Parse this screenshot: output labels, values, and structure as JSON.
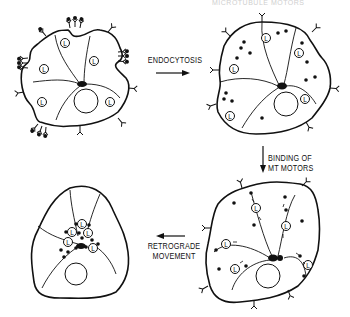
{
  "header": {
    "text": "MICROTUBULE MOTORS"
  },
  "steps": [
    {
      "id": "initial",
      "description": "Cell with surface receptors clustering ligand; lysosomes (L) scattered"
    },
    {
      "id": "endocytosed",
      "description": "Cell after endocytosis with vesicles scattered in cytoplasm"
    },
    {
      "id": "motor-binding",
      "description": "Vesicles and lysosomes bound to microtubule motors"
    },
    {
      "id": "retrograde",
      "description": "Vesicles and lysosomes clustered at the microtubule organizing center"
    }
  ],
  "arrows": {
    "endocytosis": "ENDOCYTOSIS",
    "binding_line1": "BINDING OF",
    "binding_line2": "MT MOTORS",
    "retrograde_line1": "RETROGRADE",
    "retrograde_line2": "MOVEMENT"
  },
  "legend": {
    "lysosome_symbol": "L"
  },
  "colors": {
    "ink": "#111111",
    "background": "#ffffff"
  }
}
